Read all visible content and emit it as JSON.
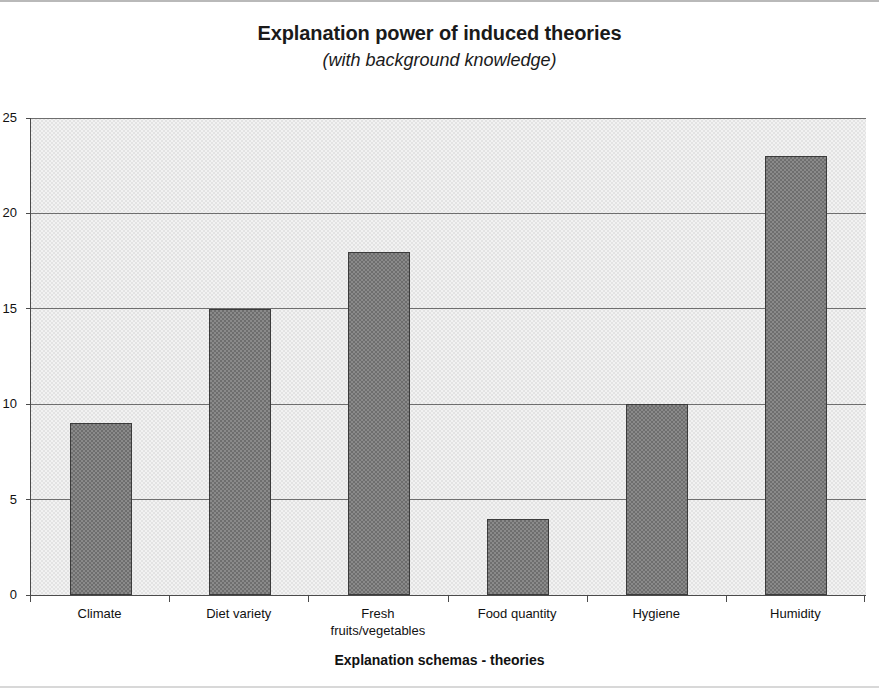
{
  "chart_data": {
    "type": "bar",
    "title": "Explanation power of induced theories",
    "subtitle": "(with background knowledge)",
    "xlabel": "Explanation schemas - theories",
    "ylabel": "",
    "categories": [
      "Climate",
      "Diet variety",
      "Fresh\nfruits/vegetables",
      "Food quantity",
      "Hygiene",
      "Humidity"
    ],
    "values": [
      9,
      15,
      18,
      4,
      10,
      23
    ],
    "ylim": [
      0,
      25
    ],
    "ytick_labels": [
      "0",
      "5",
      "10",
      "15",
      "20",
      "25"
    ],
    "ytick_values": [
      0,
      5,
      10,
      15,
      20,
      25
    ],
    "grid": true,
    "legend": false,
    "colors": {
      "bar_fill": "#7a7a7a",
      "bar_edge": "#3b3b3b",
      "plot_background": "#e3e3e3",
      "gridline": "#6e6e6e",
      "axis": "#4b4b4b",
      "text": "#111111"
    }
  }
}
